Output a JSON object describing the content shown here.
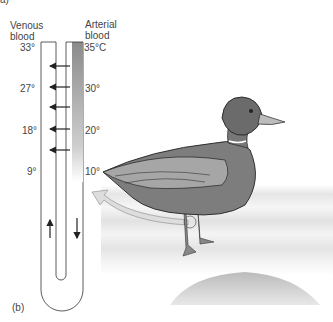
{
  "corner_label": "a)",
  "panel_label": "(b)",
  "venous": {
    "label_line1": "Venous",
    "label_line2": "blood",
    "temps": [
      "33°",
      "27°",
      "18°",
      "9°"
    ]
  },
  "arterial": {
    "label_line1": "Arterial",
    "label_line2": "blood",
    "temps": [
      "35°C",
      "30°",
      "20°",
      "10°"
    ]
  },
  "colors": {
    "duck_body": "#7a7a7a",
    "duck_head": "#6b6b6b",
    "water": "#e8e8e8",
    "arterial_gradient": "#9a9a9a"
  }
}
